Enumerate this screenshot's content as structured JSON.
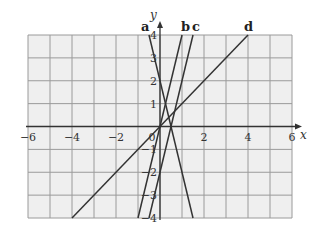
{
  "chart_data": {
    "type": "line",
    "title": "",
    "xlabel": "x",
    "ylabel": "y",
    "xlim": [
      -6,
      6
    ],
    "ylim": [
      -4,
      4
    ],
    "grid": true,
    "x_ticks": [
      -6,
      -4,
      -2,
      0,
      2,
      4,
      6
    ],
    "y_ticks": [
      -4,
      -3,
      -2,
      -1,
      0,
      1,
      2,
      3,
      4
    ],
    "x_tick_labels": [
      "−6",
      "−4",
      "−2",
      "0",
      "2",
      "4",
      "6"
    ],
    "y_tick_labels": [
      "−4",
      "−3",
      "−2",
      "−1",
      "",
      "1",
      "2",
      "3",
      "4"
    ],
    "legend": "labels at line tops",
    "series": [
      {
        "name": "a",
        "equation": "y = -4x + 2",
        "points": [
          [
            -0.5,
            4
          ],
          [
            1.5,
            -4
          ]
        ]
      },
      {
        "name": "b",
        "equation": "y = 4x",
        "points": [
          [
            -1,
            -4
          ],
          [
            1,
            4
          ]
        ]
      },
      {
        "name": "c",
        "equation": "y = 4x - 2",
        "points": [
          [
            -0.5,
            -4
          ],
          [
            1.5,
            4
          ]
        ]
      },
      {
        "name": "d",
        "equation": "y = x",
        "points": [
          [
            -4,
            -4
          ],
          [
            4,
            4
          ]
        ]
      }
    ],
    "colors": {
      "background": "#efefef",
      "grid": "#9a9a9a",
      "line": "#333333",
      "axis": "#333333"
    }
  }
}
